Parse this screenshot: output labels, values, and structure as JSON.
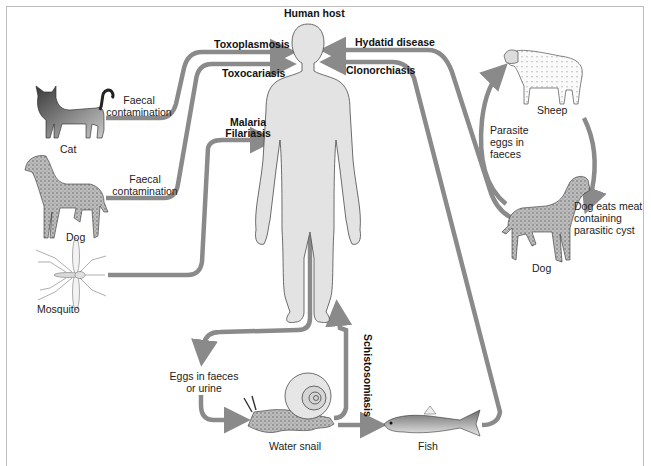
{
  "diagram": {
    "title": "Human host",
    "colors": {
      "arrow": "#8a8a8a",
      "body_fill": "#e3e3e3",
      "body_stroke": "#4a4a4a",
      "frame": "#bdbdbd",
      "text": "#222222"
    },
    "nodes": {
      "human_host": "Human host",
      "cat": "Cat",
      "dog_left": "Dog",
      "mosquito": "Mosquito",
      "sheep": "Sheep",
      "dog_right": "Dog",
      "water_snail": "Water snail",
      "fish": "Fish"
    },
    "diseases": {
      "toxoplasmosis": "Toxoplasmosis",
      "toxocariasis": "Toxocariasis",
      "malaria": "Malaria",
      "filariasis": "Filariasis",
      "hydatid": "Hydatid disease",
      "clonorchiasis": "Clonorchiasis",
      "schistosomiasis": "Schistosomiasis"
    },
    "annotations": {
      "cat_faecal_1": "Faecal",
      "cat_faecal_2": "contamination",
      "dog_faecal_1": "Faecal",
      "dog_faecal_2": "contamination",
      "parasite_eggs_1": "Parasite",
      "parasite_eggs_2": "eggs in",
      "parasite_eggs_3": "faeces",
      "dog_eats_1": "Dog eats meat",
      "dog_eats_2": "containing",
      "dog_eats_3": "parasitic cyst",
      "eggs_faeces_1": "Eggs in faeces",
      "eggs_faeces_2": "or urine"
    },
    "edges": [
      {
        "from": "Cat",
        "to": "Human host",
        "label": "Toxoplasmosis"
      },
      {
        "from": "Dog",
        "to": "Human host",
        "label": "Toxocariasis"
      },
      {
        "from": "Mosquito",
        "to": "Human host",
        "label": "Malaria / Filariasis"
      },
      {
        "from": "Dog",
        "to": "Human host",
        "label": "Hydatid disease"
      },
      {
        "from": "Fish",
        "to": "Human host",
        "label": "Clonorchiasis"
      },
      {
        "from": "Dog",
        "to": "Sheep",
        "label": "Parasite eggs in faeces"
      },
      {
        "from": "Sheep",
        "to": "Dog",
        "label": "Dog eats meat containing parasitic cyst"
      },
      {
        "from": "Human host",
        "to": "Water snail",
        "label": "Eggs in faeces or urine"
      },
      {
        "from": "Water snail",
        "to": "Human host",
        "label": "Schistosomiasis"
      },
      {
        "from": "Water snail",
        "to": "Fish",
        "label": ""
      }
    ]
  }
}
